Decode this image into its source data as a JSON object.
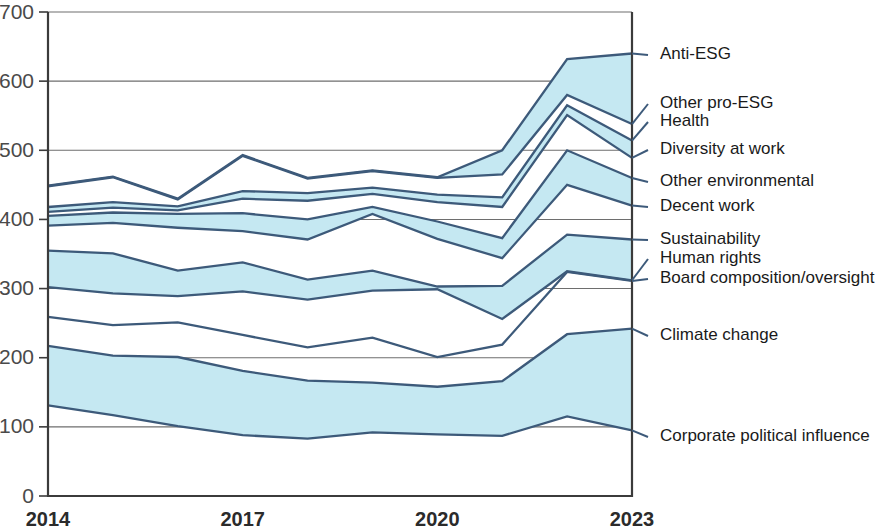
{
  "chart_data": {
    "type": "area",
    "title": "",
    "subtitle": "",
    "xlabel": "",
    "ylabel": "",
    "stacked": true,
    "grid": true,
    "legend_position": "right-inline",
    "x": [
      2014,
      2015,
      2016,
      2017,
      2018,
      2019,
      2020,
      2021,
      2022,
      2023
    ],
    "xtick_labels": [
      "2014",
      "2017",
      "2020",
      "2023"
    ],
    "xtick_values": [
      2014,
      2017,
      2020,
      2023
    ],
    "ytick_labels": [
      "0",
      "100",
      "200",
      "300",
      "400",
      "500",
      "600",
      "700"
    ],
    "ytick_values": [
      0,
      100,
      200,
      300,
      400,
      500,
      600,
      700
    ],
    "ylim": [
      0,
      700
    ],
    "xlim": [
      2014,
      2023
    ],
    "fill_color": "#c5e8f2",
    "line_color": "#3d5a7a",
    "grid_color": "#6e6e6e",
    "axis_color": "#3b3b3b",
    "series": [
      {
        "name": "Corporate political influence",
        "filled": false,
        "values": [
          131,
          117,
          101,
          88,
          83,
          92,
          89,
          87,
          115,
          95
        ]
      },
      {
        "name": "Climate change",
        "filled": true,
        "values": [
          217,
          203,
          201,
          181,
          167,
          164,
          158,
          166,
          234,
          242
        ]
      },
      {
        "name": "Board composition/oversight",
        "filled": false,
        "values": [
          259,
          247,
          251,
          233,
          215,
          229,
          201,
          219,
          324,
          311
        ]
      },
      {
        "name": "Human rights",
        "filled": false,
        "values": [
          302,
          293,
          289,
          296,
          284,
          297,
          299,
          256,
          325,
          312
        ]
      },
      {
        "name": "Sustainability",
        "filled": true,
        "values": [
          355,
          351,
          326,
          338,
          313,
          326,
          303,
          304,
          378,
          371
        ]
      },
      {
        "name": "Decent work",
        "filled": false,
        "values": [
          391,
          395,
          388,
          383,
          371,
          408,
          372,
          344,
          450,
          420
        ]
      },
      {
        "name": "Other environmental",
        "filled": true,
        "values": [
          405,
          410,
          408,
          409,
          400,
          418,
          397,
          373,
          500,
          460
        ]
      },
      {
        "name": "Diversity at work",
        "filled": false,
        "values": [
          411,
          417,
          413,
          430,
          427,
          437,
          425,
          418,
          551,
          489
        ]
      },
      {
        "name": "Health",
        "filled": true,
        "values": [
          418,
          425,
          419,
          441,
          438,
          446,
          436,
          432,
          565,
          514
        ]
      },
      {
        "name": "Other pro-ESG",
        "filled": false,
        "values": [
          448,
          461,
          429,
          492,
          459,
          470,
          460,
          465,
          580,
          538
        ]
      },
      {
        "name": "Anti-ESG",
        "filled": true,
        "values": [
          449,
          462,
          430,
          493,
          460,
          471,
          461,
          500,
          632,
          640
        ]
      }
    ],
    "legend_entries": [
      {
        "label": "Anti-ESG",
        "value_at_end": 640
      },
      {
        "label": "Other pro-ESG",
        "value_at_end": 538
      },
      {
        "label": "Health",
        "value_at_end": 514
      },
      {
        "label": "Diversity at work",
        "value_at_end": 489
      },
      {
        "label": "Other environmental",
        "value_at_end": 460
      },
      {
        "label": "Decent work",
        "value_at_end": 420
      },
      {
        "label": "Sustainability",
        "value_at_end": 371
      },
      {
        "label": "Human rights",
        "value_at_end": 312
      },
      {
        "label": "Board composition/oversight",
        "value_at_end": 311
      },
      {
        "label": "Climate change",
        "value_at_end": 242
      },
      {
        "label": "Corporate political influence",
        "value_at_end": 95
      }
    ]
  }
}
